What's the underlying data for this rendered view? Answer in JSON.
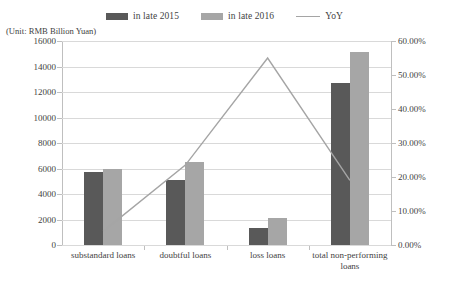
{
  "unit_caption": "(Unit: RMB Billion Yuan)",
  "legend": {
    "items": [
      {
        "label": "in late 2015",
        "type": "bar",
        "color": "#595959"
      },
      {
        "label": "in late 2016",
        "type": "bar",
        "color": "#a6a6a6"
      },
      {
        "label": "YoY",
        "type": "line",
        "color": "#a5a5a5"
      }
    ]
  },
  "chart_data": {
    "type": "bar",
    "title": "",
    "subtitle": "",
    "xlabel": "",
    "ylabel": "(Unit: RMB Billion Yuan)",
    "categories": [
      "substandard loans",
      "doubtful loans",
      "loss loans",
      "total non-performing loans"
    ],
    "series": [
      {
        "name": "in late 2015",
        "type": "bar",
        "axis": "left",
        "color": "#595959",
        "values": [
          5750,
          5100,
          1350,
          12700
        ]
      },
      {
        "name": "in late 2016",
        "type": "bar",
        "axis": "left",
        "color": "#a6a6a6",
        "values": [
          6000,
          6500,
          2150,
          15100
        ]
      },
      {
        "name": "YoY",
        "type": "line",
        "axis": "right",
        "color": "#a5a5a5",
        "values": [
          0.04,
          0.235,
          0.55,
          0.19
        ]
      }
    ],
    "ylim": [
      0,
      16000
    ],
    "yticks": [
      0,
      2000,
      4000,
      6000,
      8000,
      10000,
      12000,
      14000,
      16000
    ],
    "ytick_labels": [
      "0",
      "2000",
      "4000",
      "6000",
      "8000",
      "10000",
      "12000",
      "14000",
      "16000"
    ],
    "y2lim": [
      0,
      0.6
    ],
    "y2ticks": [
      0,
      0.1,
      0.2,
      0.3,
      0.4,
      0.5,
      0.6
    ],
    "y2tick_labels": [
      "0.00%",
      "10.00%",
      "20.00%",
      "30.00%",
      "40.00%",
      "50.00%",
      "60.00%"
    ],
    "grid": true,
    "legend_position": "top"
  }
}
